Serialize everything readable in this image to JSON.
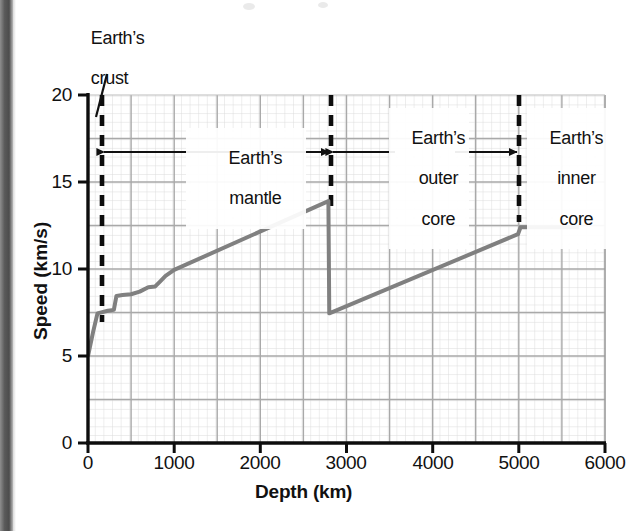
{
  "chart_data": {
    "type": "line",
    "title": "",
    "xlabel": "Depth (km)",
    "ylabel": "Speed (km/s)",
    "xlim": [
      0,
      6000
    ],
    "ylim": [
      0,
      20
    ],
    "xticks": [
      0,
      1000,
      2000,
      3000,
      4000,
      5000,
      6000
    ],
    "yticks": [
      0,
      5,
      10,
      15,
      20
    ],
    "xtick_labels": [
      "0",
      "1000",
      "2000",
      "3000",
      "4000",
      "5000",
      "6000"
    ],
    "ytick_labels": [
      "0",
      "5",
      "10",
      "15",
      "20"
    ],
    "grid": true,
    "grid_major_x": 500,
    "grid_major_y": 2.5,
    "grid_minor_x": 100,
    "grid_minor_y": 0.5,
    "legend": "none",
    "line_color": "#808080",
    "line_width": 4,
    "series": [
      {
        "name": "Seismic wave speed",
        "points": [
          [
            0,
            5.0
          ],
          [
            60,
            6.4
          ],
          [
            110,
            7.45
          ],
          [
            230,
            7.6
          ],
          [
            300,
            7.65
          ],
          [
            330,
            8.45
          ],
          [
            400,
            8.5
          ],
          [
            500,
            8.55
          ],
          [
            600,
            8.7
          ],
          [
            700,
            8.95
          ],
          [
            780,
            9.0
          ],
          [
            830,
            9.25
          ],
          [
            900,
            9.6
          ],
          [
            1000,
            9.95
          ],
          [
            2790,
            13.9
          ],
          [
            2800,
            7.45
          ],
          [
            4990,
            12.0
          ],
          [
            5020,
            12.4
          ],
          [
            5700,
            12.4
          ]
        ]
      }
    ],
    "boundaries": [
      {
        "name": "crust-boundary",
        "depth": 80,
        "style": "dashed"
      },
      {
        "name": "mantle-core-boundary",
        "depth": 2800,
        "style": "dashed"
      },
      {
        "name": "outer-inner-core-boundary",
        "depth": 5000,
        "style": "dashed"
      }
    ],
    "annotations": [
      {
        "name": "earths-crust",
        "label": "Earth’s\ncrust",
        "lines": [
          "Earth’s",
          "crust"
        ],
        "leader": true
      },
      {
        "name": "earths-mantle",
        "label": "Earth’s\nmantle",
        "lines": [
          "Earth’s",
          "mantle"
        ],
        "arrow": "double",
        "from_depth": 80,
        "to_depth": 2800
      },
      {
        "name": "earths-outer-core",
        "label": "Earth’s\nouter\ncore",
        "lines": [
          "Earth’s",
          "outer",
          "core"
        ],
        "arrow": "double",
        "from_depth": 2800,
        "to_depth": 5000
      },
      {
        "name": "earths-inner-core",
        "label": "Earth’s\ninner\ncore",
        "lines": [
          "Earth’s",
          "inner",
          "core"
        ],
        "arrow": "none",
        "from_depth": 5000,
        "to_depth": 6000
      }
    ]
  },
  "axes": {
    "x_title": "Depth (km)",
    "y_title": "Speed (km/s)",
    "x_labels": [
      "0",
      "1000",
      "2000",
      "3000",
      "4000",
      "5000",
      "6000"
    ],
    "y_labels": [
      "20",
      "15",
      "10",
      "5",
      "0"
    ]
  },
  "labels": {
    "crust_line1": "Earth’s",
    "crust_line2": "crust",
    "mantle_line1": "Earth’s",
    "mantle_line2": "mantle",
    "outer_core_line1": "Earth’s",
    "outer_core_line2": "outer",
    "outer_core_line3": "core",
    "inner_core_line1": "Earth’s",
    "inner_core_line2": "inner",
    "inner_core_line3": "core"
  },
  "colors": {
    "line": "#808080",
    "axis": "#000000",
    "grid_major": "#a8a8a8",
    "grid_minor": "#d8d8d8",
    "text": "#111111",
    "gutter": "#4c4c4c"
  }
}
